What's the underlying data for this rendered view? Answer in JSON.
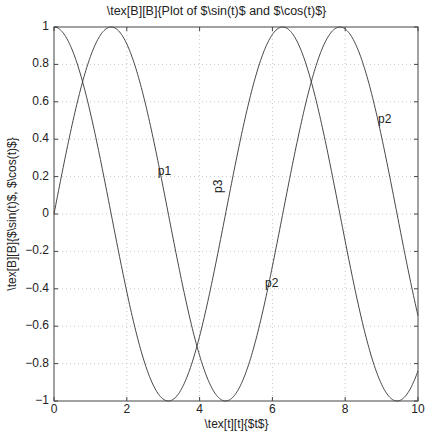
{
  "chart_data": {
    "type": "line",
    "title": "\\tex[B][B]{Plot of $\\sin(t)$ and $\\cos(t)$}",
    "xlabel": "\\tex[t][t]{$t$}",
    "ylabel": "\\tex[B][B]{$\\sin(t)$, $\\cos(t)$}",
    "xlim": [
      0,
      10
    ],
    "ylim": [
      -1,
      1
    ],
    "xticks": [
      "0",
      "2",
      "4",
      "6",
      "8",
      "10"
    ],
    "yticks": [
      "1",
      "0.8",
      "0.6",
      "0.4",
      "0.2",
      "0",
      "−0.2",
      "−0.4",
      "−0.6",
      "−0.8",
      "−1"
    ],
    "grid": true,
    "legend": null,
    "series": [
      {
        "name": "sin(t)",
        "function": "sin",
        "color": "#333333",
        "x": [
          0,
          1,
          2,
          3,
          4,
          5,
          6,
          7,
          8,
          9,
          10
        ],
        "values": [
          0,
          0.841,
          0.909,
          0.141,
          -0.757,
          -0.959,
          -0.279,
          0.657,
          0.989,
          0.412,
          -0.544
        ]
      },
      {
        "name": "cos(t)",
        "function": "cos",
        "color": "#333333",
        "x": [
          0,
          1,
          2,
          3,
          4,
          5,
          6,
          7,
          8,
          9,
          10
        ],
        "values": [
          1,
          0.54,
          -0.416,
          -0.99,
          -0.654,
          0.284,
          0.96,
          0.754,
          -0.146,
          -0.911,
          -0.839
        ]
      }
    ],
    "annotations": [
      {
        "text": "p1",
        "x": 2.85,
        "y": 0.22,
        "rotation": 0
      },
      {
        "text": "p3",
        "x": 4.5,
        "y": 0.15,
        "rotation": 90
      },
      {
        "text": "p2",
        "x": 5.8,
        "y": -0.38,
        "rotation": 0
      },
      {
        "text": "p2",
        "x": 8.9,
        "y": 0.5,
        "rotation": 0
      }
    ]
  },
  "labels": {
    "title": "\\tex[B][B]{Plot of $\\sin(t)$ and $\\cos(t)$}",
    "xlabel": "\\tex[t][t]{$t$}",
    "ylabel": "\\tex[B][B]{$\\sin(t)$, $\\cos(t)$}"
  }
}
